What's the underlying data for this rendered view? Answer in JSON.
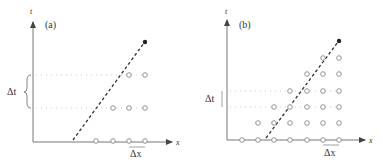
{
  "figure": {
    "panels": [
      {
        "id": "a",
        "label": "(a)",
        "y_axis_label": "t",
        "x_axis_label": "x",
        "dt_label": "Δt",
        "dx_label": "Δx",
        "description": "Coarse grid: time step larger; characteristic (dashed) line passes outside domain of dependence"
      },
      {
        "id": "b",
        "label": "(b)",
        "y_axis_label": "t",
        "x_axis_label": "x",
        "dt_label": "Δt",
        "dx_label": "Δx",
        "description": "Finer time step; grid points cover the characteristic (dashed) line"
      }
    ],
    "colors": {
      "axis": "#555555",
      "grid_point": "#888888",
      "dotted_guide": "#cccccc",
      "characteristic_line": "#333333",
      "endpoint": "#222222"
    }
  }
}
